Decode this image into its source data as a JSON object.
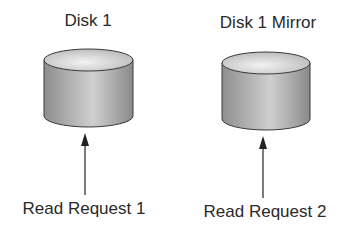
{
  "diagram": {
    "disks": [
      {
        "title": "Disk 1",
        "request": "Read Request 1"
      },
      {
        "title": "Disk 1 Mirror",
        "request": "Read Request 2"
      }
    ],
    "colors": {
      "cylinder_dark": "#8a8a8a",
      "cylinder_light": "#d8d8d8",
      "outline": "#3a3a3a",
      "arrow": "#333333",
      "text": "#2a2a2a"
    }
  }
}
